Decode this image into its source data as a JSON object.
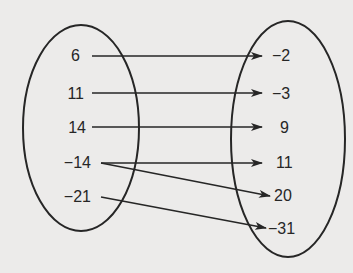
{
  "diagram": {
    "type": "mapping-diagram",
    "colors": {
      "background": "#ecebea",
      "ink": "#262626"
    },
    "domain": {
      "label": "domain-set",
      "values": [
        "6",
        "11",
        "14",
        "−14",
        "−21"
      ]
    },
    "range": {
      "label": "range-set",
      "values": [
        "−2",
        "−3",
        "9",
        "11",
        "20",
        "−31"
      ]
    },
    "mappings": [
      {
        "from": "6",
        "to": "−2"
      },
      {
        "from": "11",
        "to": "−3"
      },
      {
        "from": "14",
        "to": "9"
      },
      {
        "from": "−14",
        "to": "11"
      },
      {
        "from": "−14",
        "to": "20"
      },
      {
        "from": "−21",
        "to": "−31"
      }
    ]
  }
}
